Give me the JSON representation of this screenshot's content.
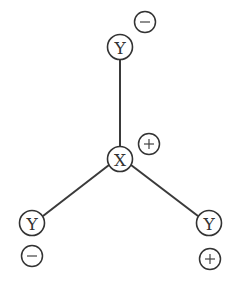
{
  "diagram": {
    "center_atom": {
      "label": "X",
      "cx": 120,
      "cy": 159,
      "r": 12.5,
      "charge": {
        "sign": "+",
        "cx": 149,
        "cy": 144,
        "r": 10.5
      }
    },
    "ligands": [
      {
        "label": "Y",
        "position": "top",
        "cx": 120,
        "cy": 47,
        "r": 12.5,
        "charge": {
          "sign": "-",
          "cx": 145,
          "cy": 22,
          "r": 10.5
        }
      },
      {
        "label": "Y",
        "position": "bottom-left",
        "cx": 32,
        "cy": 223,
        "r": 12.5,
        "charge": {
          "sign": "-",
          "cx": 32,
          "cy": 256,
          "r": 10.5
        }
      },
      {
        "label": "Y",
        "position": "bottom-right",
        "cx": 209,
        "cy": 223,
        "r": 12.5,
        "charge": {
          "sign": "+",
          "cx": 210,
          "cy": 259,
          "r": 10.5
        }
      }
    ],
    "colors": {
      "stroke": "#333333",
      "background": "#ffffff"
    }
  }
}
